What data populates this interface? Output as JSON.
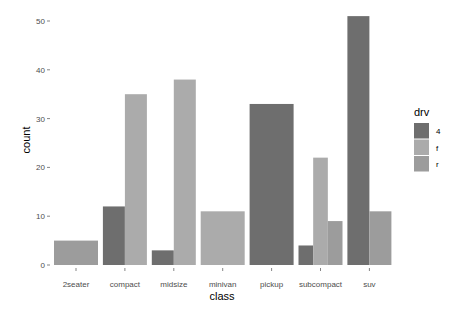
{
  "chart_data": {
    "type": "bar",
    "subtype": "dodged",
    "title": "",
    "xlabel": "class",
    "ylabel": "count",
    "ylim": [
      0,
      52
    ],
    "yticks": [
      0,
      10,
      20,
      30,
      40,
      50
    ],
    "grid": false,
    "legend_position": "right",
    "legend_title": "drv",
    "categories": [
      "2seater",
      "compact",
      "midsize",
      "minivan",
      "pickup",
      "subcompact",
      "suv"
    ],
    "series": [
      {
        "name": "4",
        "color": "#6e6e6e",
        "values": [
          null,
          12,
          3,
          null,
          33,
          4,
          51
        ]
      },
      {
        "name": "f",
        "color": "#ababab",
        "values": [
          null,
          35,
          38,
          11,
          null,
          22,
          null
        ]
      },
      {
        "name": "r",
        "color": "#9c9c9c",
        "values": [
          5,
          null,
          null,
          null,
          null,
          9,
          11
        ]
      }
    ]
  }
}
